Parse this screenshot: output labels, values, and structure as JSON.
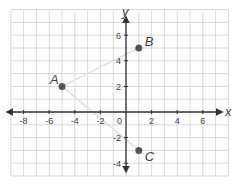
{
  "diagram": {
    "type": "coordinate-plane",
    "axes": {
      "x_label": "x",
      "y_label": "y",
      "x_range": [
        -9,
        8
      ],
      "y_range": [
        -5,
        8
      ],
      "x_ticks": [
        {
          "value": -8,
          "label": "-8"
        },
        {
          "value": -6,
          "label": "-6"
        },
        {
          "value": -4,
          "label": "-4"
        },
        {
          "value": -2,
          "label": "-2"
        },
        {
          "value": 2,
          "label": "2"
        },
        {
          "value": 4,
          "label": "4"
        },
        {
          "value": 6,
          "label": "6"
        }
      ],
      "y_ticks": [
        {
          "value": 6,
          "label": "6"
        },
        {
          "value": 4,
          "label": "4"
        },
        {
          "value": 2,
          "label": "2"
        },
        {
          "value": -2,
          "label": "-2"
        },
        {
          "value": -4,
          "label": "-4"
        }
      ],
      "origin_label": "0"
    },
    "points": [
      {
        "name": "A",
        "x": -5,
        "y": 2
      },
      {
        "name": "B",
        "x": 1,
        "y": 5
      },
      {
        "name": "C",
        "x": 1,
        "y": -3
      }
    ],
    "segments": [
      {
        "from": "A",
        "to": "B"
      },
      {
        "from": "A",
        "to": "C"
      }
    ],
    "colors": {
      "grid": "#cfcfcf",
      "axis": "#333333",
      "segment": "#e0e0e0",
      "point": "#555555",
      "text": "#444444"
    }
  }
}
